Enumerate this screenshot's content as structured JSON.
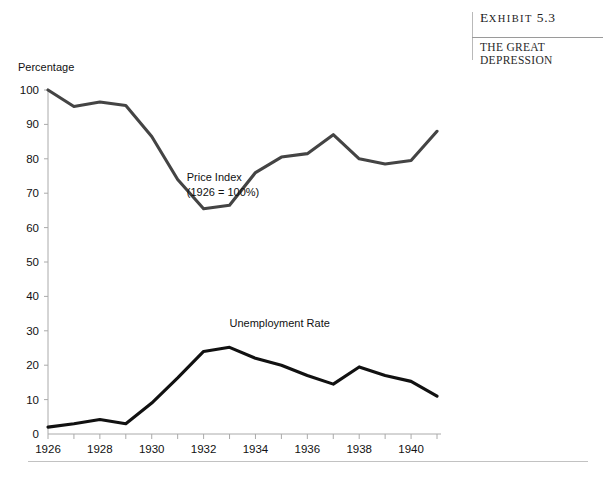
{
  "exhibit": {
    "label_first": "E",
    "label_rest": "XHIBIT",
    "number": "5.3",
    "subtitle_line1": "THE GREAT",
    "subtitle_line2": "DEPRESSION"
  },
  "chart_data": {
    "type": "line",
    "title": "THE GREAT DEPRESSION",
    "xlabel": "",
    "ylabel": "Percentage",
    "ylim": [
      0,
      100
    ],
    "xlim": [
      1926,
      1941
    ],
    "yticks": [
      0,
      10,
      20,
      30,
      40,
      50,
      60,
      70,
      80,
      90,
      100
    ],
    "xticks": [
      1926,
      1927,
      1928,
      1929,
      1930,
      1931,
      1932,
      1933,
      1934,
      1935,
      1936,
      1937,
      1938,
      1939,
      1940,
      1941
    ],
    "xtick_labels": [
      "1926",
      "",
      "1928",
      "",
      "1930",
      "",
      "1932",
      "",
      "1934",
      "",
      "1936",
      "",
      "1938",
      "",
      "1940",
      ""
    ],
    "grid": false,
    "legend_position": "inline-annotation",
    "x": [
      1926,
      1927,
      1928,
      1929,
      1930,
      1931,
      1932,
      1933,
      1934,
      1935,
      1936,
      1937,
      1938,
      1939,
      1940,
      1941
    ],
    "series": [
      {
        "name": "Price Index (1926 = 100%)",
        "annotation_line1": "Price Index",
        "annotation_line2": "(1926 = 100%)",
        "color": "#444444",
        "values": [
          100,
          95.2,
          96.5,
          95.5,
          86.5,
          74.0,
          65.5,
          66.5,
          76.0,
          80.5,
          81.5,
          87.0,
          80.0,
          78.5,
          79.5,
          88.0
        ]
      },
      {
        "name": "Unemployment Rate",
        "annotation_line1": "Unemployment Rate",
        "annotation_line2": "",
        "color": "#111111",
        "values": [
          2.0,
          3.0,
          4.2,
          3.0,
          9.0,
          16.3,
          24.0,
          25.2,
          22.0,
          20.0,
          17.0,
          14.5,
          19.5,
          17.0,
          15.3,
          11.0
        ]
      }
    ],
    "annotations": [
      {
        "text": "Price Index",
        "x": 1931.3,
        "y": 73
      },
      {
        "text": "(1926 = 100%)",
        "x": 1931.3,
        "y": 69
      },
      {
        "text": "Unemployment Rate",
        "x": 1933.0,
        "y": 31
      }
    ]
  },
  "axis": {
    "y_title": "Percentage",
    "y_labels": [
      "100",
      "90",
      "80",
      "70",
      "60",
      "50",
      "40",
      "30",
      "20",
      "10",
      "0"
    ],
    "x_labels": [
      "1926",
      "1928",
      "1930",
      "1932",
      "1934",
      "1936",
      "1938",
      "1940"
    ]
  }
}
